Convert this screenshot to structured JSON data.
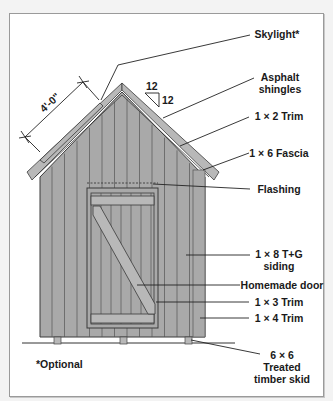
{
  "diagram": {
    "colors": {
      "siding": "#a9a9a9",
      "siding_line": "#555555",
      "trim": "#b8b8b8",
      "outline": "#3a3a3a",
      "frame_border": "#9a9a9a",
      "background": "#ffffff"
    },
    "dimension": {
      "label": "4'-0\""
    },
    "pitch": {
      "rise": "12",
      "run": "12"
    },
    "labels": [
      {
        "id": "skylight",
        "lines": [
          "Skylight*"
        ]
      },
      {
        "id": "asphalt-shingles",
        "lines": [
          "Asphalt",
          "shingles"
        ]
      },
      {
        "id": "trim-1x2",
        "lines": [
          "1 × 2 Trim"
        ]
      },
      {
        "id": "fascia-1x6",
        "lines": [
          "1 × 6 Fascia"
        ]
      },
      {
        "id": "flashing",
        "lines": [
          "Flashing"
        ]
      },
      {
        "id": "siding-1x8",
        "lines": [
          "1 × 8 T+G",
          "siding"
        ]
      },
      {
        "id": "homemade-door",
        "lines": [
          "Homemade door"
        ]
      },
      {
        "id": "trim-1x3",
        "lines": [
          "1 × 3 Trim"
        ]
      },
      {
        "id": "trim-1x4",
        "lines": [
          "1 × 4 Trim"
        ]
      },
      {
        "id": "skid",
        "lines": [
          "6 × 6",
          "Treated",
          "timber skid"
        ]
      }
    ],
    "footnote": "*Optional"
  }
}
